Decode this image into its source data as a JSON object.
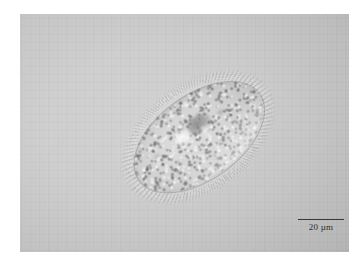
{
  "figure": {
    "type": "light-micrograph",
    "technique": "differential-interference-contrast",
    "background_color": "#c9c9c9",
    "page_color": "#ffffff"
  },
  "micrograph": {
    "frame": {
      "left": 20,
      "top": 14,
      "width": 329,
      "height": 238
    },
    "alt_text": "Differential interference contrast micrograph of a single ovoid ciliate protozoan with granular cytoplasm and a fringe of cilia, shown against a plain light gray field."
  },
  "cell": {
    "label": "ciliate-cell",
    "shape": "ovoid-ellipsoid",
    "rotation_deg": -36,
    "center": {
      "x": 178,
      "y": 123
    },
    "long_axis_px": 148,
    "short_axis_px": 84,
    "features": [
      {
        "name": "cilia-fringe",
        "description": "radiating cilia around the cell margin"
      },
      {
        "name": "macronucleus",
        "description": "darker rounded mass in the anterior third"
      },
      {
        "name": "contractile-vacuole",
        "description": "bright refractile vacuole"
      },
      {
        "name": "cytoplasmic-granules",
        "description": "dense fine granulation filling the cytoplasm"
      },
      {
        "name": "dic-shadow",
        "description": "dark relief along the upper-left margin"
      },
      {
        "name": "dic-highlight",
        "description": "bright relief along the lower-right margin"
      }
    ]
  },
  "scale_bar": {
    "label": "20 µm",
    "value": 20,
    "unit": "µm",
    "bar_length_px": 46,
    "bar_color": "#3a3a3a",
    "text_color": "#2e2e2e",
    "position": "bottom-right"
  }
}
